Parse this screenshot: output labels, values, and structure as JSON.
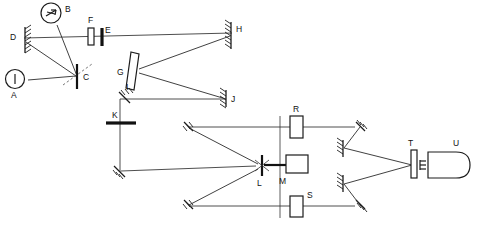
{
  "figure": {
    "kind": "optical-layout-diagram",
    "background_color": "#ffffff",
    "line_color": "#1c1c1c",
    "beam_color": "#2b2b2b",
    "width": 477,
    "height": 225
  },
  "labels": {
    "a": "A",
    "b": "B",
    "c": "C",
    "d": "D",
    "e": "E",
    "f": "F",
    "g": "G",
    "h": "H",
    "i": "I",
    "j": "J",
    "k": "K",
    "l": "L",
    "m": "M",
    "r": "R",
    "s": "S",
    "t": "T",
    "u": "U"
  },
  "components": [
    {
      "id": "A",
      "label": "A",
      "type": "source-circle",
      "note": "circle with vertical bar inside"
    },
    {
      "id": "B",
      "label": "B",
      "type": "source-circle",
      "note": "circle with arrow symbol inside"
    },
    {
      "id": "C",
      "label": "C",
      "type": "beamsplitter",
      "note": "vertical bar with dashed diagonal"
    },
    {
      "id": "D",
      "label": "D",
      "type": "mirror",
      "note": "hatched vertical mirror, left"
    },
    {
      "id": "E",
      "label": "E",
      "type": "aperture",
      "note": "thick vertical bar"
    },
    {
      "id": "F",
      "label": "F",
      "type": "window",
      "note": "small upright rectangle"
    },
    {
      "id": "G",
      "label": "G",
      "type": "tilted-plate",
      "note": "tilted rectangle plate"
    },
    {
      "id": "H",
      "label": "H",
      "type": "mirror",
      "note": "hatched vertical mirror, right"
    },
    {
      "id": "I",
      "label": "I",
      "type": "mirror",
      "note": "small hatched fold mirror"
    },
    {
      "id": "J",
      "label": "J",
      "type": "mirror",
      "note": "hatched vertical mirror"
    },
    {
      "id": "K",
      "label": "K",
      "type": "bar-stop",
      "note": "thick horizontal bar on vertical beam"
    },
    {
      "id": "L",
      "label": "L",
      "type": "beam-combiner",
      "note": "crossed fold element"
    },
    {
      "id": "M",
      "label": "M",
      "type": "detector",
      "note": "horizontal rectangle box"
    },
    {
      "id": "R",
      "label": "R",
      "type": "cell",
      "note": "upright rectangle on upper arm"
    },
    {
      "id": "S",
      "label": "S",
      "type": "cell",
      "note": "upright rectangle on lower arm"
    },
    {
      "id": "T",
      "label": "T",
      "type": "window",
      "note": "narrow upright rectangle"
    },
    {
      "id": "U",
      "label": "U",
      "type": "chamber",
      "note": "rounded capsule body"
    }
  ]
}
